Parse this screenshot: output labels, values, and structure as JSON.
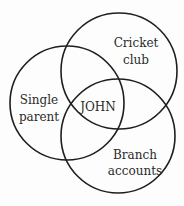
{
  "diagram": {
    "type": "venn",
    "sets": [
      {
        "id": "single-parent",
        "line1": "Single",
        "line2": "parent"
      },
      {
        "id": "cricket-club",
        "line1": "Cricket",
        "line2": "club"
      },
      {
        "id": "branch-accounts",
        "line1": "Branch",
        "line2": "accounts"
      }
    ],
    "intersection_label": "JOHN",
    "stroke_color": "#1e1e1e",
    "background": "#fdfdfd"
  }
}
